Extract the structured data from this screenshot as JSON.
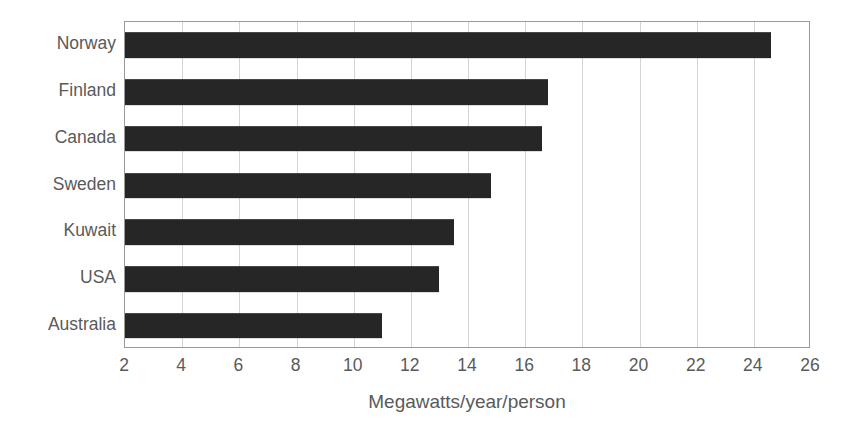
{
  "chart_data": {
    "type": "bar",
    "orientation": "horizontal",
    "title": "",
    "subtitle": "",
    "xlabel": "Megawatts/year/person",
    "ylabel": "",
    "categories": [
      "Norway",
      "Finland",
      "Canada",
      "Sweden",
      "Kuwait",
      "USA",
      "Australia"
    ],
    "values": [
      24.6,
      16.8,
      16.6,
      14.8,
      13.5,
      13.0,
      11.0
    ],
    "series": [
      {
        "name": "Energy use per person",
        "values": [
          24.6,
          16.8,
          16.6,
          14.8,
          13.5,
          13.0,
          11.0
        ]
      }
    ],
    "xlim": [
      2,
      26
    ],
    "xticks": [
      2,
      4,
      6,
      8,
      10,
      12,
      14,
      16,
      18,
      20,
      22,
      24,
      26
    ],
    "xtick_labels": [
      "2",
      "4",
      "6",
      "8",
      "10",
      "12",
      "14",
      "16",
      "18",
      "20",
      "22",
      "24",
      "26"
    ],
    "grid": "vertical",
    "legend": "none",
    "bar_color": "#262626",
    "gridline_color": "#d4d4d4",
    "axis_border_color": "#9a9a9a",
    "text_color": "#5a5a5a",
    "background_color": "#ffffff",
    "annotations": []
  }
}
